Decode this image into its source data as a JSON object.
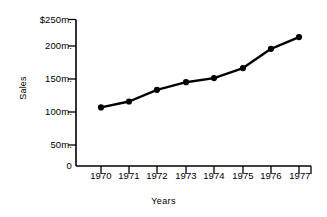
{
  "chart_data": {
    "type": "line",
    "title": "",
    "xlabel": "Years",
    "ylabel": "Sales",
    "categories": [
      "1970",
      "1971",
      "1972",
      "1973",
      "1974",
      "1975",
      "1976",
      "1977"
    ],
    "values": [
      100,
      110,
      130,
      143,
      150,
      167,
      200,
      220
    ],
    "value_unit": "millions of dollars",
    "ylim": [
      0,
      250
    ],
    "y_ticks": [
      0,
      50,
      100,
      150,
      200,
      250
    ],
    "y_tick_labels": [
      "0",
      "50m.",
      "100m.",
      "150m.",
      "200m.",
      "$250m."
    ],
    "x_tick_labels": [
      "1970",
      "1971",
      "1972",
      "1973",
      "1974",
      "1975",
      "1976",
      "1977"
    ],
    "grid": false,
    "legend": false,
    "legend_position": "none",
    "series": [
      {
        "name": "Sales",
        "values": [
          100,
          110,
          130,
          143,
          150,
          167,
          200,
          220
        ]
      }
    ],
    "marker": "filled-circle",
    "colors": {
      "line": "#000000",
      "marker": "#000000",
      "axis": "#000000",
      "background": "#ffffff"
    }
  },
  "axes": {
    "y_title": "Sales",
    "x_title": "Years",
    "y_labels": [
      {
        "text": "$250m.",
        "value": 250
      },
      {
        "text": "200m.",
        "value": 200
      },
      {
        "text": "150m.",
        "value": 150
      },
      {
        "text": "100m.",
        "value": 100
      },
      {
        "text": "50m.",
        "value": 50
      },
      {
        "text": "0",
        "value": 0
      }
    ],
    "x_labels": [
      {
        "text": "1970"
      },
      {
        "text": "1971"
      },
      {
        "text": "1972"
      },
      {
        "text": "1973"
      },
      {
        "text": "1974"
      },
      {
        "text": "1975"
      },
      {
        "text": "1976"
      },
      {
        "text": "1977"
      }
    ]
  }
}
